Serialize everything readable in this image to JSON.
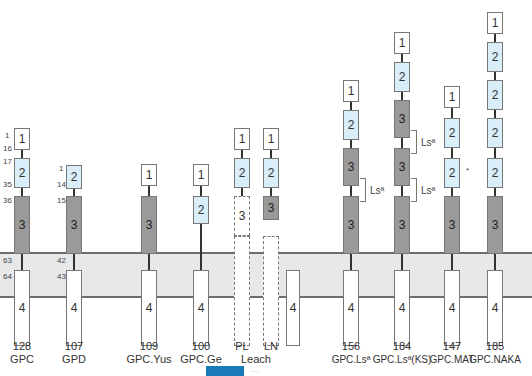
{
  "figure": {
    "type": "glycophorin C/D domain structure variants",
    "membrane": "lipid bilayer band",
    "domain_labels": [
      "1",
      "2",
      "3",
      "4"
    ],
    "residue_numbers_gpc": [
      "1",
      "16",
      "17",
      "35",
      "36",
      "63",
      "64"
    ],
    "residue_numbers_gpd": [
      "1",
      "14",
      "15",
      "42",
      "43"
    ],
    "leach_pl_number": "3",
    "variants": [
      {
        "length": "128",
        "name": "GPC"
      },
      {
        "length": "107",
        "name": "GPD"
      },
      {
        "length": "109",
        "name": "GPC.Yus"
      },
      {
        "length": "100",
        "name": "GPC.Ge"
      },
      {
        "length": "PL",
        "name": ""
      },
      {
        "length": "LN",
        "name": ""
      },
      {
        "length": "156",
        "name": "GPC.Lsª"
      },
      {
        "length": "184",
        "name": "GPC.Lsª(KS)"
      },
      {
        "length": "147",
        "name": "GPC.MAT"
      },
      {
        "length": "185",
        "name": "GPC.NAKA"
      }
    ],
    "leach_label": "Leach",
    "ls_label": "Lsª",
    "asterisk": "*",
    "caption": "…"
  }
}
